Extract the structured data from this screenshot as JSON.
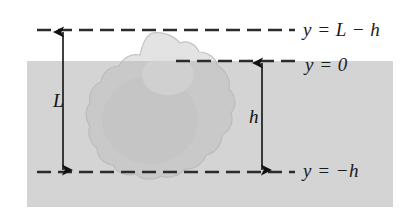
{
  "figure": {
    "canvas": {
      "width": 419,
      "height": 222,
      "background": "#ffffff"
    },
    "fluid": {
      "name": "water-region",
      "color": "#d4d4d4",
      "surface_level_label": "y = 0",
      "rect": {
        "x": 27,
        "y": 61,
        "width": 366,
        "height": 146
      }
    },
    "body": {
      "name": "floating-block",
      "above_water_color": "#e2e2e2",
      "below_water_color": "#c8c8c8",
      "outline_color": "#b4b4b4"
    },
    "reference_lines": [
      {
        "id": "line-top",
        "label": "y = L − h",
        "y": 30,
        "x_start": 37,
        "x_end": 295,
        "color": "#2b2b2b",
        "dash": "14 7"
      },
      {
        "id": "line-surface",
        "label": "y = 0",
        "y": 61,
        "x_start": 176,
        "x_end": 295,
        "color": "#2b2b2b",
        "dash": "14 7"
      },
      {
        "id": "line-bottom",
        "label": "y = −h",
        "y": 172,
        "x_start": 37,
        "x_end": 295,
        "color": "#2b2b2b",
        "dash": "14 7"
      }
    ],
    "dimensions": [
      {
        "id": "dimension-L",
        "symbol": "L",
        "x": 63,
        "y_top": 30,
        "y_bottom": 172,
        "description": "total height of the block"
      },
      {
        "id": "dimension-h",
        "symbol": "h",
        "x": 262,
        "y_top": 61,
        "y_bottom": 172,
        "description": "submerged depth of the block"
      }
    ],
    "labels": {
      "top": "y = L − h",
      "surface": "y = 0",
      "bottom": "y = −h",
      "length_L": "L",
      "depth_h": "h"
    }
  }
}
